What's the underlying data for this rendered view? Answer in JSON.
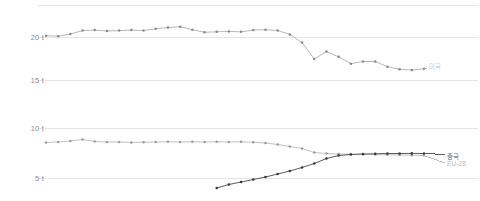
{
  "chart_data": {
    "type": "line",
    "title": "",
    "subtitle": "",
    "xlabel": "",
    "ylabel": "",
    "unit_suffix": "t",
    "grid": true,
    "grid_color": "#e6e6e6",
    "legend_position": "right-inline",
    "background": "#ffffff",
    "panels": [
      {
        "name": "upper-panel",
        "ylim": [
          14.0,
          22.2
        ],
        "yticks": [
          20,
          15
        ],
        "ytick_labels": [
          "20 t",
          "15 t"
        ],
        "series": [
          {
            "name": "미국",
            "label": "미국",
            "color": "#b0b0b0",
            "marker": "circle",
            "marker_color": "#8a8a8a",
            "x": [
              0,
              1,
              2,
              3,
              4,
              5,
              6,
              7,
              8,
              9,
              10,
              11,
              12,
              13,
              14,
              15,
              16,
              17,
              18,
              19,
              20,
              21,
              22,
              23,
              24,
              25,
              26,
              27
            ],
            "values": [
              20.15,
              20.1,
              20.35,
              20.75,
              20.8,
              20.7,
              20.75,
              20.8,
              20.75,
              20.95,
              21.1,
              21.2,
              20.85,
              20.55,
              20.6,
              20.65,
              20.6,
              20.8,
              20.85,
              20.75,
              20.3,
              19.35,
              17.45,
              18.3,
              17.7,
              16.9,
              17.15,
              17.15
            ],
            "tail_values": [
              16.55,
              16.25,
              16.15,
              16.3
            ]
          }
        ]
      },
      {
        "name": "lower-panel",
        "ylim": [
          3.6,
          10.6
        ],
        "yticks": [
          10,
          5
        ],
        "ytick_labels": [
          "10 t",
          "5 t"
        ],
        "series": [
          {
            "name": "EU-28",
            "label": "EU-28",
            "color": "#b9b9b9",
            "marker": "circle",
            "marker_color": "#9a9a9a",
            "x": [
              0,
              1,
              2,
              3,
              4,
              5,
              6,
              7,
              8,
              9,
              10,
              11,
              12,
              13,
              14,
              15,
              16,
              17,
              18,
              19,
              20,
              21,
              22,
              23,
              24,
              25,
              26,
              27,
              28,
              29,
              30,
              31
            ],
            "values": [
              8.55,
              8.6,
              8.7,
              8.85,
              8.65,
              8.6,
              8.6,
              8.55,
              8.58,
              8.6,
              8.62,
              8.6,
              8.62,
              8.6,
              8.62,
              8.6,
              8.62,
              8.58,
              8.5,
              8.35,
              8.15,
              7.95,
              7.55,
              7.45,
              7.4,
              7.38,
              7.36,
              7.34,
              7.32,
              7.3,
              7.28,
              7.25
            ]
          },
          {
            "name": "중국",
            "label": "중국",
            "color": "#4a4a4a",
            "marker": "circle",
            "marker_color": "#3a3a3a",
            "x": [
              14,
              15,
              16,
              17,
              18,
              19,
              20,
              21,
              22,
              23,
              24,
              25,
              26,
              27,
              28,
              29,
              30,
              31
            ],
            "values": [
              4.0,
              4.35,
              4.6,
              4.85,
              5.1,
              5.4,
              5.7,
              6.05,
              6.45,
              6.95,
              7.25,
              7.35,
              7.4,
              7.42,
              7.45,
              7.45,
              7.46,
              7.45
            ]
          }
        ]
      }
    ]
  },
  "labels": {
    "upper_tick_20": "20 t",
    "upper_tick_15": "15 t",
    "lower_tick_10": "10 t",
    "lower_tick_5": "5 t",
    "series_us": "미국",
    "series_cn": "중국",
    "series_eu": "EU-28"
  }
}
